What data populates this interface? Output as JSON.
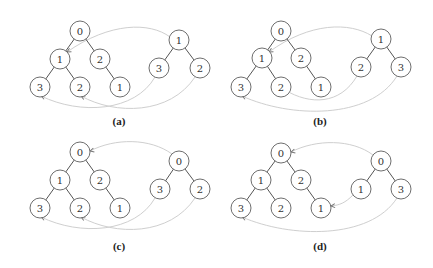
{
  "figure": {
    "node_radius": 10,
    "colors": {
      "node_stroke": "#6e6e6e",
      "edge": "#555555",
      "arc": "#cfcfcf",
      "arrow": "#777777"
    },
    "panels": [
      {
        "caption": "(a)",
        "caption_pos": [
          119,
          125
        ],
        "left_tree": {
          "nodes": [
            {
              "id": "L0",
              "label": "0",
              "x": 80,
              "y": 31
            },
            {
              "id": "L1",
              "label": "1",
              "x": 60,
              "y": 59
            },
            {
              "id": "L2",
              "label": "2",
              "x": 100,
              "y": 59
            },
            {
              "id": "L3",
              "label": "3",
              "x": 40,
              "y": 87
            },
            {
              "id": "L4",
              "label": "2",
              "x": 80,
              "y": 87
            },
            {
              "id": "L5",
              "label": "1",
              "x": 120,
              "y": 87
            }
          ],
          "edges": [
            [
              "L0",
              "L1"
            ],
            [
              "L0",
              "L2"
            ],
            [
              "L1",
              "L3"
            ],
            [
              "L1",
              "L4"
            ],
            [
              "L2",
              "L5"
            ]
          ]
        },
        "right_tree": {
          "nodes": [
            {
              "id": "R0",
              "label": "1",
              "x": 179,
              "y": 40
            },
            {
              "id": "R1",
              "label": "3",
              "x": 159,
              "y": 68
            },
            {
              "id": "R2",
              "label": "2",
              "x": 200,
              "y": 68
            }
          ],
          "edges": [
            [
              "R0",
              "R1"
            ],
            [
              "R0",
              "R2"
            ]
          ]
        },
        "arcs": [
          {
            "d": "M170,37 C150,22 110,22 67,52",
            "arrow_at": [
              67,
              52
            ],
            "arrow_angle": 150
          },
          {
            "d": "M155,77 C135,112 80,115 41,96",
            "arrow_at": [
              41,
              96
            ],
            "arrow_angle": 200
          },
          {
            "d": "M195,77 C170,115 115,115 81,96",
            "arrow_at": [
              81,
              96
            ],
            "arrow_angle": 205
          }
        ]
      },
      {
        "caption": "(b)",
        "caption_pos": [
          320,
          125
        ],
        "left_tree": {
          "nodes": [
            {
              "id": "L0",
              "label": "0",
              "x": 281,
              "y": 31
            },
            {
              "id": "L1",
              "label": "1",
              "x": 262,
              "y": 58
            },
            {
              "id": "L2",
              "label": "2",
              "x": 301,
              "y": 58
            },
            {
              "id": "L3",
              "label": "3",
              "x": 241,
              "y": 87
            },
            {
              "id": "L4",
              "label": "2",
              "x": 281,
              "y": 87
            },
            {
              "id": "L5",
              "label": "1",
              "x": 321,
              "y": 87
            }
          ],
          "edges": [
            [
              "L0",
              "L1"
            ],
            [
              "L0",
              "L2"
            ],
            [
              "L1",
              "L3"
            ],
            [
              "L1",
              "L4"
            ],
            [
              "L2",
              "L5"
            ]
          ]
        },
        "right_tree": {
          "nodes": [
            {
              "id": "R0",
              "label": "1",
              "x": 381,
              "y": 39
            },
            {
              "id": "R1",
              "label": "2",
              "x": 361,
              "y": 67
            },
            {
              "id": "R2",
              "label": "3",
              "x": 401,
              "y": 67
            }
          ],
          "edges": [
            [
              "R0",
              "R1"
            ],
            [
              "R0",
              "R2"
            ]
          ]
        },
        "arcs": [
          {
            "d": "M372,36 C350,22 310,22 269,52",
            "arrow_at": [
              269,
              52
            ],
            "arrow_angle": 150
          },
          {
            "d": "M357,76 C340,105 310,105 285,90",
            "arrow_at": [
              285,
              90
            ],
            "arrow_angle": 210
          },
          {
            "d": "M397,76 C370,120 290,118 242,96",
            "arrow_at": [
              242,
              96
            ],
            "arrow_angle": 200
          }
        ]
      },
      {
        "caption": "(c)",
        "caption_pos": [
          119,
          250
        ],
        "left_tree": {
          "nodes": [
            {
              "id": "L0",
              "label": "0",
              "x": 80,
              "y": 152
            },
            {
              "id": "L1",
              "label": "1",
              "x": 60,
              "y": 180
            },
            {
              "id": "L2",
              "label": "2",
              "x": 100,
              "y": 180
            },
            {
              "id": "L3",
              "label": "3",
              "x": 40,
              "y": 208
            },
            {
              "id": "L4",
              "label": "2",
              "x": 80,
              "y": 208
            },
            {
              "id": "L5",
              "label": "1",
              "x": 120,
              "y": 208
            }
          ],
          "edges": [
            [
              "L0",
              "L1"
            ],
            [
              "L0",
              "L2"
            ],
            [
              "L1",
              "L3"
            ],
            [
              "L1",
              "L4"
            ],
            [
              "L2",
              "L5"
            ]
          ]
        },
        "right_tree": {
          "nodes": [
            {
              "id": "R0",
              "label": "0",
              "x": 179,
              "y": 161
            },
            {
              "id": "R1",
              "label": "3",
              "x": 160,
              "y": 189
            },
            {
              "id": "R2",
              "label": "2",
              "x": 200,
              "y": 189
            }
          ],
          "edges": [
            [
              "R0",
              "R1"
            ],
            [
              "R0",
              "R2"
            ]
          ]
        },
        "arcs": [
          {
            "d": "M172,154 C150,138 115,138 90,151",
            "arrow_at": [
              90,
              151
            ],
            "arrow_angle": 165
          },
          {
            "d": "M155,198 C135,233 80,236 41,217",
            "arrow_at": [
              41,
              217
            ],
            "arrow_angle": 200
          },
          {
            "d": "M195,198 C170,236 115,236 81,217",
            "arrow_at": [
              81,
              217
            ],
            "arrow_angle": 205
          }
        ]
      },
      {
        "caption": "(d)",
        "caption_pos": [
          320,
          250
        ],
        "left_tree": {
          "nodes": [
            {
              "id": "L0",
              "label": "0",
              "x": 281,
              "y": 153
            },
            {
              "id": "L1",
              "label": "1",
              "x": 261,
              "y": 180
            },
            {
              "id": "L2",
              "label": "2",
              "x": 301,
              "y": 180
            },
            {
              "id": "L3",
              "label": "3",
              "x": 241,
              "y": 208
            },
            {
              "id": "L4",
              "label": "2",
              "x": 281,
              "y": 208
            },
            {
              "id": "L5",
              "label": "1",
              "x": 321,
              "y": 208
            }
          ],
          "edges": [
            [
              "L0",
              "L1"
            ],
            [
              "L0",
              "L2"
            ],
            [
              "L1",
              "L3"
            ],
            [
              "L1",
              "L4"
            ],
            [
              "L2",
              "L5"
            ]
          ]
        },
        "right_tree": {
          "nodes": [
            {
              "id": "R0",
              "label": "0",
              "x": 381,
              "y": 161
            },
            {
              "id": "R1",
              "label": "1",
              "x": 361,
              "y": 189
            },
            {
              "id": "R2",
              "label": "3",
              "x": 401,
              "y": 189
            }
          ],
          "edges": [
            [
              "R0",
              "R1"
            ],
            [
              "R0",
              "R2"
            ]
          ]
        },
        "arcs": [
          {
            "d": "M373,155 C352,139 316,139 291,152",
            "arrow_at": [
              291,
              152
            ],
            "arrow_angle": 165
          },
          {
            "d": "M353,195 C345,203 340,205 331,206",
            "arrow_at": [
              331,
              206
            ],
            "arrow_angle": 175
          },
          {
            "d": "M397,198 C370,240 290,238 242,217",
            "arrow_at": [
              242,
              217
            ],
            "arrow_angle": 200
          }
        ]
      }
    ]
  }
}
